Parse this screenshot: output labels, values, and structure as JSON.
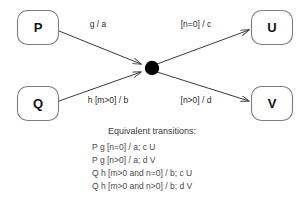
{
  "diagram": {
    "background_color": "#ffffff",
    "line_color": "#3a3a3a",
    "box_stroke_color": "#7d7d7d",
    "junction_color": "#000000",
    "states": {
      "source_p": "P",
      "source_q": "Q",
      "target_u": "U",
      "target_v": "V"
    },
    "edges": {
      "p_to_junction": "g / a",
      "q_to_junction": "h [m>0] / b",
      "junction_to_u": "[n=0] / c",
      "junction_to_v": "[n>0] / d"
    }
  },
  "legend": {
    "heading": "Equivalent transitions:",
    "lines": [
      "P g [n=0] / a; c U",
      "P g [n>0] / a; d V",
      "Q h [m>0 and n=0] / b; c U",
      "Q h [m>0 and n>0] / b; d V"
    ]
  }
}
